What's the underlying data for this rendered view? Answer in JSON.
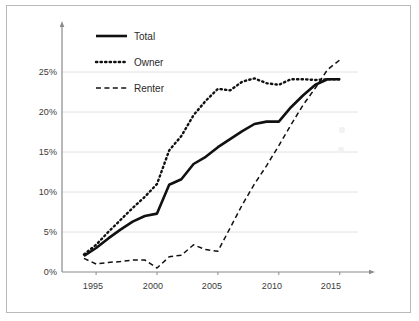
{
  "chart_data": {
    "type": "line",
    "title": "",
    "xlabel": "",
    "ylabel": "",
    "xlim": [
      1992.2,
      2016.5
    ],
    "ylim": [
      0,
      27.8
    ],
    "grid": true,
    "grid_axis": "y",
    "legend_position": "top-left",
    "x_ticks": [
      "1995",
      "2000",
      "2005",
      "2010",
      "2015"
    ],
    "x_tick_values": [
      1995,
      2000,
      2005,
      2010,
      2015
    ],
    "y_ticks": [
      "0%",
      "5%",
      "10%",
      "15%",
      "20%",
      "25%"
    ],
    "y_tick_values": [
      0,
      5,
      10,
      15,
      20,
      25
    ],
    "x": [
      1994,
      1995,
      1996,
      1997,
      1998,
      1999,
      2000,
      2001,
      2002,
      2003,
      2004,
      2005,
      2006,
      2007,
      2008,
      2009,
      2010,
      2011,
      2012,
      2013,
      2014,
      2015
    ],
    "series": [
      {
        "name": "Total",
        "style": "solid",
        "color": "#111111",
        "width": 2.6,
        "values": [
          2.0,
          3.0,
          4.2,
          5.3,
          6.3,
          7.0,
          7.3,
          10.9,
          11.6,
          13.5,
          14.4,
          15.6,
          16.6,
          17.6,
          18.5,
          18.8,
          18.8,
          20.6,
          22.1,
          23.4,
          24.1,
          24.1
        ]
      },
      {
        "name": "Owner",
        "style": "dotted",
        "color": "#111111",
        "width": 2.4,
        "values": [
          2.2,
          3.4,
          5.0,
          6.5,
          8.0,
          9.4,
          11.0,
          15.2,
          17.0,
          19.6,
          21.4,
          22.9,
          22.7,
          23.8,
          24.2,
          23.6,
          23.4,
          24.1,
          24.1,
          24.0,
          24.1,
          24.1
        ]
      },
      {
        "name": "Renter",
        "style": "dashed",
        "color": "#111111",
        "width": 1.5,
        "values": [
          1.7,
          1.0,
          1.2,
          1.3,
          1.5,
          1.5,
          0.5,
          1.9,
          2.1,
          3.4,
          2.8,
          2.6,
          5.5,
          8.4,
          11.0,
          13.3,
          15.8,
          18.4,
          20.9,
          23.0,
          25.3,
          26.5
        ]
      }
    ],
    "legend": [
      {
        "label": "Total",
        "style": "solid"
      },
      {
        "label": "Owner",
        "style": "dotted"
      },
      {
        "label": "Renter",
        "style": "dashed"
      }
    ]
  },
  "axis": {
    "y_arrow": true,
    "x_arrow": true
  }
}
